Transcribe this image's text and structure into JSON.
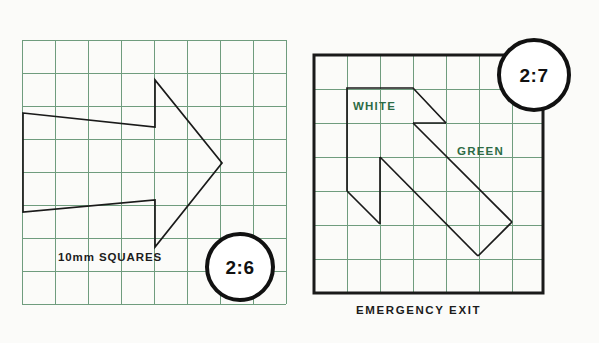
{
  "page": {
    "background_color": "#fbfbf9",
    "grid_line_color": "#6f9c7e",
    "shape_line_color": "#1a1a1a",
    "green_text_color": "#2d6b45",
    "black_text_color": "#1c1c1c"
  },
  "left_panel": {
    "name": "straight-arrow-grid",
    "badge_label": "2:6",
    "caption": "10mm SQUARES",
    "grid": {
      "x": 22,
      "y": 40,
      "cell": 33,
      "cols": 8,
      "rows": 8,
      "line_color": "#6f9c7e"
    },
    "arrow_points": "23,113 155,127 155,80 222,163 155,247 155,200 23,212"
  },
  "right_panel": {
    "name": "diagonal-arrow-grid",
    "badge_label": "2:7",
    "caption": "EMERGENCY EXIT",
    "label_white": "WHITE",
    "label_green": "GREEN",
    "grid": {
      "x": 314,
      "y": 55,
      "cell": 32.7,
      "cols": 7,
      "rows": 7,
      "line_color": "#6f9c7e",
      "border_color": "#1a1a1a",
      "border_width": 3
    },
    "arrow_points": "347,88 413,88 413,121 446,121 446,154 413,154 413,121 380,154 380,219 347,219 347,154 380,154 446,154 479,187 512,220 479,253 446,220 413,187 380,154"
  },
  "shapes": {
    "left_arrow_outline": [
      {
        "x": 23,
        "y": 113
      },
      {
        "x": 155,
        "y": 127
      },
      {
        "x": 155,
        "y": 80
      },
      {
        "x": 222,
        "y": 163
      },
      {
        "x": 155,
        "y": 247
      },
      {
        "x": 155,
        "y": 200
      },
      {
        "x": 23,
        "y": 212
      }
    ],
    "right_arrow_outline": [
      {
        "x": 347,
        "y": 88
      },
      {
        "x": 413,
        "y": 88
      },
      {
        "x": 446,
        "y": 121
      },
      {
        "x": 413,
        "y": 121
      },
      {
        "x": 512,
        "y": 220
      },
      {
        "x": 512,
        "y": 187
      },
      {
        "x": 478,
        "y": 263
      },
      {
        "x": 413,
        "y": 187
      },
      {
        "x": 380,
        "y": 220
      },
      {
        "x": 347,
        "y": 187
      },
      {
        "x": 347,
        "y": 154
      },
      {
        "x": 380,
        "y": 154
      }
    ]
  }
}
